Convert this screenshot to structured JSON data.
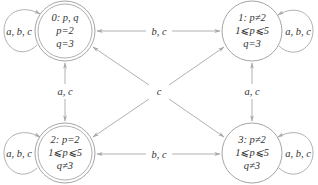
{
  "diagram": {
    "type": "state-transition-graph",
    "colors": {
      "edge": "#a8a8a8",
      "node_border": "#9a9a9a",
      "text": "#333333",
      "background": "#ffffff"
    },
    "nodes": [
      {
        "id": "0",
        "accepting": true,
        "line1": "0: p, q",
        "line2": "p=2",
        "line3": "q=3",
        "self_loop_label": "a, b, c",
        "self_loop_side": "left"
      },
      {
        "id": "1",
        "accepting": false,
        "line1": "1: p≠2",
        "line2": "1⩽p⩽5",
        "line3": "q=3",
        "self_loop_label": "a, b, c",
        "self_loop_side": "right"
      },
      {
        "id": "2",
        "accepting": true,
        "line1": "2: p=2",
        "line2": "1⩽p⩽5",
        "line3": "q≠3",
        "self_loop_label": "a, b, c",
        "self_loop_side": "left"
      },
      {
        "id": "3",
        "accepting": false,
        "line1": "3: p≠2",
        "line2": "1⩽p⩽5",
        "line3": "q≠3",
        "self_loop_label": "a, b, c",
        "self_loop_side": "right"
      }
    ],
    "edges": [
      {
        "from": "0",
        "to": "1",
        "label": "b, c",
        "bidirectional": true
      },
      {
        "from": "2",
        "to": "3",
        "label": "b, c",
        "bidirectional": true
      },
      {
        "from": "0",
        "to": "2",
        "label": "a, c",
        "bidirectional": true
      },
      {
        "from": "1",
        "to": "3",
        "label": "a, c",
        "bidirectional": true
      },
      {
        "from": "0",
        "to": "3",
        "label": "c",
        "bidirectional": true
      },
      {
        "from": "1",
        "to": "2",
        "label": "c",
        "bidirectional": true
      }
    ],
    "center_label": "c"
  }
}
